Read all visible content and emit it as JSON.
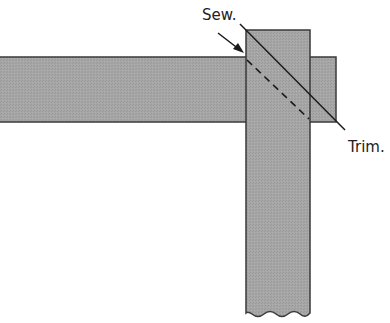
{
  "diagram": {
    "title": "",
    "labels": {
      "sew": "Sew.",
      "trim": "Trim."
    },
    "colors": {
      "fabric": "#a6a6a6",
      "fabric_stroke": "#3a3a3a",
      "line": "#1a1a1a",
      "background": "#ffffff"
    },
    "elements": [
      {
        "id": "horizontal-strip",
        "description": "Horizontal fabric strip extending from the left edge"
      },
      {
        "id": "vertical-strip",
        "description": "Vertical fabric strip laid on top at right angle, wavy bottom edge"
      },
      {
        "id": "sew-line",
        "description": "Dashed diagonal stitching line"
      },
      {
        "id": "trim-line",
        "description": "Solid diagonal cutting line"
      }
    ]
  }
}
